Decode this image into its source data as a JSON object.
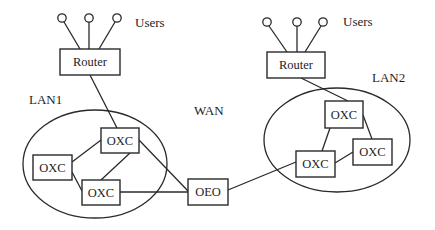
{
  "diagram": {
    "type": "network-topology",
    "labels": {
      "users_left": "Users",
      "users_right": "Users",
      "lan1": "LAN1",
      "lan2": "LAN2",
      "wan": "WAN"
    },
    "nodes": {
      "router_left": "Router",
      "router_right": "Router",
      "oxc_lan1_top": "OXC",
      "oxc_lan1_left": "OXC",
      "oxc_lan1_bottom": "OXC",
      "oeo": "OEO",
      "oxc_lan2_top": "OXC",
      "oxc_lan2_right": "OXC",
      "oxc_lan2_bottom": "OXC"
    },
    "edges": [
      [
        "user_l1",
        "router_left"
      ],
      [
        "user_l2",
        "router_left"
      ],
      [
        "user_l3",
        "router_left"
      ],
      [
        "router_left",
        "oxc_lan1_top"
      ],
      [
        "oxc_lan1_top",
        "oxc_lan1_left"
      ],
      [
        "oxc_lan1_top",
        "oxc_lan1_bottom"
      ],
      [
        "oxc_lan1_left",
        "oxc_lan1_bottom"
      ],
      [
        "oxc_lan1_top",
        "oeo"
      ],
      [
        "oxc_lan1_bottom",
        "oeo"
      ],
      [
        "oeo",
        "oxc_lan2_bottom"
      ],
      [
        "user_r1",
        "router_right"
      ],
      [
        "user_r2",
        "router_right"
      ],
      [
        "user_r3",
        "router_right"
      ],
      [
        "router_right",
        "oxc_lan2_top"
      ],
      [
        "oxc_lan2_top",
        "oxc_lan2_bottom"
      ],
      [
        "oxc_lan2_top",
        "oxc_lan2_right"
      ],
      [
        "oxc_lan2_bottom",
        "oxc_lan2_right"
      ]
    ],
    "colors": {
      "stroke": "#2a2a2a",
      "background": "#ffffff",
      "text": "#1e1e1e"
    }
  }
}
